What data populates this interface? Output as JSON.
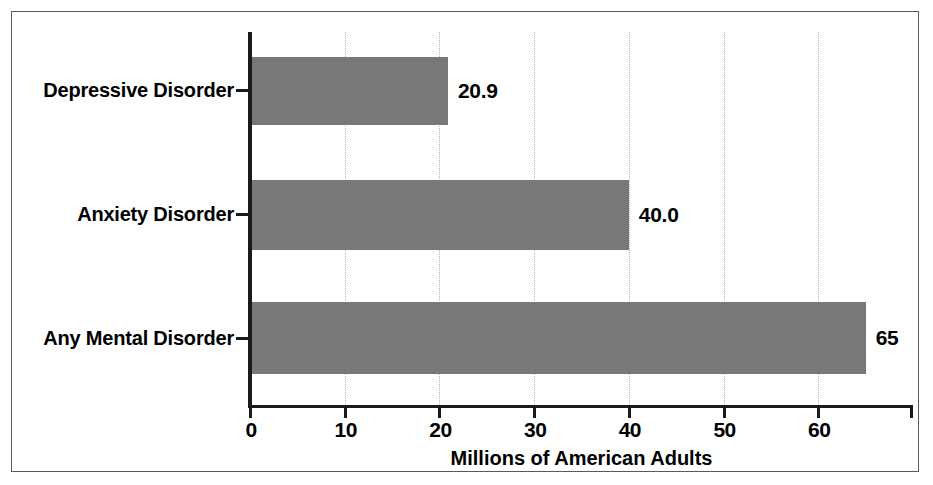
{
  "chart_data": {
    "type": "bar",
    "orientation": "horizontal",
    "title": "",
    "xlabel": "Millions of American Adults",
    "ylabel": "",
    "categories": [
      "Depressive Disorder",
      "Anxiety Disorder",
      "Any Mental Disorder"
    ],
    "values": [
      20.9,
      40.0,
      65
    ],
    "value_labels": [
      "20.9",
      "40.0",
      "65"
    ],
    "xlim": [
      0,
      70
    ],
    "xticks": [
      0,
      10,
      20,
      30,
      40,
      50,
      60
    ],
    "xtick_labels": [
      "0",
      "10",
      "20",
      "30",
      "40",
      "50",
      "60"
    ],
    "grid": "vertical-dotted",
    "legend": "none",
    "bar_color": "#787878",
    "axis_color": "#1a1a1a",
    "gridline_color": "#b5b5b5",
    "background_color": "#ffffff",
    "frame_color": "#5a5a5a"
  }
}
